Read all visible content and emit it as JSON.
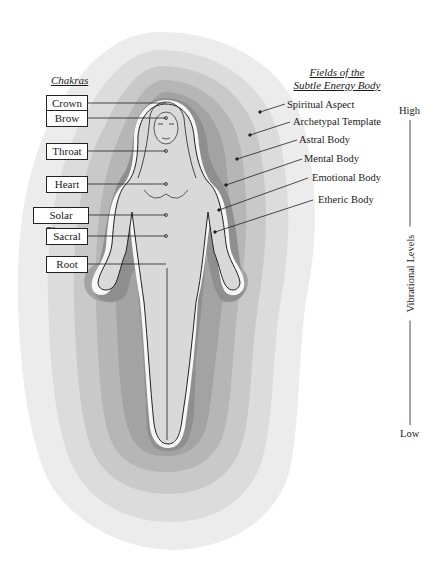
{
  "chakras": {
    "heading": "Chakras",
    "items": [
      {
        "label": "Crown"
      },
      {
        "label": "Brow"
      },
      {
        "label": "Throat"
      },
      {
        "label": "Heart"
      },
      {
        "label": "Solar Plexus"
      },
      {
        "label": "Sacral"
      },
      {
        "label": "Root"
      }
    ]
  },
  "fields": {
    "heading_line1": "Fields of the",
    "heading_line2": "Subtle Energy Body",
    "items": [
      {
        "label": "Spiritual Aspect"
      },
      {
        "label": "Archetypal Template"
      },
      {
        "label": "Astral Body"
      },
      {
        "label": "Mental Body"
      },
      {
        "label": "Emotional Body"
      },
      {
        "label": "Etheric Body"
      }
    ]
  },
  "vibrational_scale": {
    "high": "High",
    "axis_label": "Vibrational Levels",
    "low": "Low"
  },
  "colors": {
    "layer_1_spiritual": "#ececec",
    "layer_2_archetypal": "#dcdcdc",
    "layer_3_astral": "#c9c9c9",
    "layer_4_mental": "#b6b6b6",
    "layer_5_emotional": "#a3a3a3",
    "layer_6_etheric": "#8f8f8f",
    "body_fill": "#d9d9d9",
    "body_halo": "#f7f7f7"
  }
}
